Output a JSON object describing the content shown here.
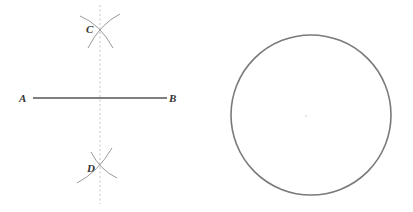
{
  "figure": {
    "labels": {
      "A": "A",
      "B": "B",
      "C": "C",
      "D": "D"
    },
    "colors": {
      "segment": "#555555",
      "arcs": "#9a9a9a",
      "bisector": "#c4c4c4",
      "circle": "#7a7a7a",
      "labels": "#333333"
    }
  }
}
